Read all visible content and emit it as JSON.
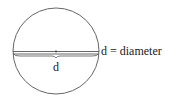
{
  "diagram": {
    "type": "circle-diameter",
    "diameter_symbol": "d",
    "definition_label": "d = diameter",
    "colors": {
      "stroke": "#555555",
      "text": "#1a1a1a",
      "background": "#ffffff"
    }
  }
}
